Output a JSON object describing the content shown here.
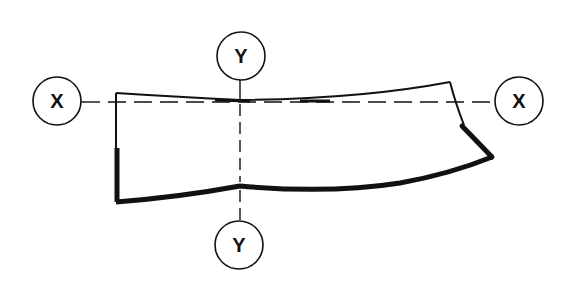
{
  "diagram": {
    "axes": {
      "x_left": {
        "label": "X"
      },
      "x_right": {
        "label": "X"
      },
      "y_top": {
        "label": "Y"
      },
      "y_bottom": {
        "label": "Y"
      }
    },
    "colors": {
      "line": "#111111",
      "background": "#ffffff"
    }
  }
}
